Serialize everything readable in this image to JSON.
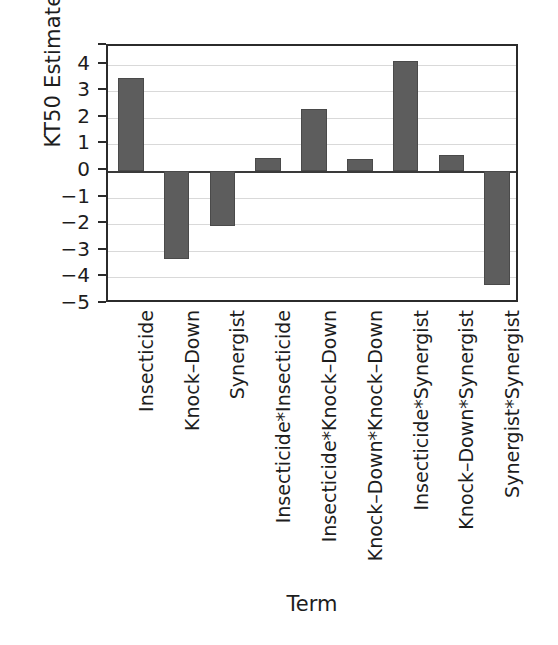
{
  "chart_data": {
    "type": "bar",
    "title": "",
    "xlabel": "Term",
    "ylabel": "KT50 Estimates",
    "ylim": [
      -5,
      4.7
    ],
    "yticks": [
      4,
      3,
      2,
      1,
      0,
      -1,
      -2,
      -3,
      -4,
      -5
    ],
    "ytick_labels": [
      "4",
      "3",
      "2",
      "1",
      "0",
      "−1",
      "−2",
      "−3",
      "−4",
      "−5"
    ],
    "grid": true,
    "legend": "none",
    "bar_color": "#5d5d5d",
    "categories": [
      "Insecticide",
      "Knock–Down",
      "Synergist",
      "Insecticide*Insecticide",
      "Insecticide*Knock–Down",
      "Knock–Down*Knock–Down",
      "Insecticide*Synergist",
      "Knock–Down*Synergist",
      "Synergist*Synergist"
    ],
    "values": [
      3.5,
      -3.3,
      -2.05,
      0.5,
      2.35,
      0.45,
      4.15,
      0.6,
      -4.3
    ]
  }
}
